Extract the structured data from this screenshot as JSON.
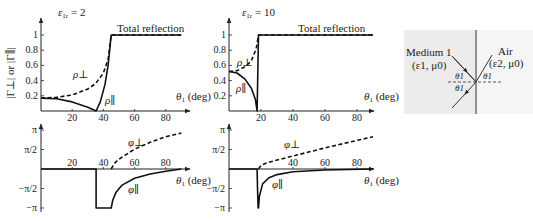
{
  "chart_data": [
    {
      "id": "mag_er2",
      "type": "line",
      "title": "ε1r = 2",
      "xlabel": "θ1 (deg)",
      "ylabel": "|Γ⊥| or |Γ∥|",
      "xlim": [
        0,
        90
      ],
      "ylim": [
        0,
        1
      ],
      "xticks": [
        20,
        40,
        60,
        80
      ],
      "yticks": [
        0.2,
        0.4,
        0.6,
        0.8,
        1
      ],
      "annotation": "Total reflection",
      "series": [
        {
          "name": "ρ⊥",
          "style": "dashed",
          "x": [
            0,
            10,
            20,
            30,
            35,
            40,
            43,
            45,
            90
          ],
          "y": [
            0.17,
            0.18,
            0.21,
            0.29,
            0.36,
            0.5,
            0.68,
            1,
            1
          ]
        },
        {
          "name": "ρ∥",
          "style": "solid",
          "x": [
            0,
            10,
            20,
            30,
            35.3,
            38,
            41,
            43,
            45,
            90
          ],
          "y": [
            0.17,
            0.16,
            0.12,
            0.05,
            0.0,
            0.12,
            0.35,
            0.6,
            1,
            1
          ]
        }
      ]
    },
    {
      "id": "mag_er10",
      "type": "line",
      "title": "ε1r = 10",
      "xlabel": "θ1 (deg)",
      "ylabel": "",
      "xlim": [
        0,
        90
      ],
      "ylim": [
        0,
        1
      ],
      "xticks": [
        20,
        40,
        60,
        80
      ],
      "yticks": [
        0.2,
        0.4,
        0.6,
        0.8,
        1
      ],
      "annotation": "Total reflection",
      "series": [
        {
          "name": "ρ⊥",
          "style": "dashed",
          "x": [
            0,
            5,
            10,
            14,
            17,
            18.43,
            90
          ],
          "y": [
            0.52,
            0.53,
            0.58,
            0.66,
            0.82,
            1,
            1
          ]
        },
        {
          "name": "ρ∥",
          "style": "solid",
          "x": [
            0,
            5,
            10,
            14,
            16.5,
            17.55,
            18.0,
            18.43,
            90
          ],
          "y": [
            0.52,
            0.5,
            0.42,
            0.3,
            0.15,
            0.0,
            0.5,
            1,
            1
          ]
        }
      ]
    },
    {
      "id": "phase_er2",
      "type": "line",
      "title": "",
      "xlabel": "θ1 (deg)",
      "ylabel": "",
      "xlim": [
        0,
        90
      ],
      "ylim": [
        -3.1416,
        3.1416
      ],
      "xticks": [
        20,
        40,
        60,
        80
      ],
      "yticks": [
        "π",
        "π/2",
        "−π/2",
        "−π"
      ],
      "series": [
        {
          "name": "φ⊥",
          "style": "dashed",
          "x": [
            45,
            47,
            50,
            60,
            70,
            80,
            90
          ],
          "y": [
            0,
            0.45,
            0.8,
            1.6,
            2.15,
            2.6,
            2.9
          ]
        },
        {
          "name": "φ∥",
          "style": "solid",
          "x": [
            0,
            35.3,
            35.3,
            45,
            46,
            48,
            52,
            60,
            70,
            80,
            90
          ],
          "y": [
            0,
            0,
            -3.1416,
            -3.1416,
            -2.5,
            -1.9,
            -1.3,
            -0.75,
            -0.4,
            -0.18,
            0
          ]
        }
      ]
    },
    {
      "id": "phase_er10",
      "type": "line",
      "title": "",
      "xlabel": "θ1 (deg)",
      "ylabel": "",
      "xlim": [
        0,
        90
      ],
      "ylim": [
        -3.1416,
        3.1416
      ],
      "xticks": [
        40,
        60,
        80
      ],
      "yticks": [
        "π",
        "π/2",
        "−π/2",
        "−π"
      ],
      "series": [
        {
          "name": "φ⊥",
          "style": "dashed",
          "x": [
            18.43,
            20,
            25,
            40,
            60,
            80,
            90
          ],
          "y": [
            0,
            0.3,
            0.55,
            1.05,
            1.7,
            2.3,
            2.6
          ]
        },
        {
          "name": "φ∥",
          "style": "solid",
          "x": [
            0,
            17.55,
            17.8,
            18.2,
            18.43,
            19,
            21,
            25,
            30,
            40,
            60,
            90
          ],
          "y": [
            0,
            0,
            -1.5,
            -3.1416,
            -3.1416,
            -2.2,
            -1.2,
            -0.7,
            -0.45,
            -0.22,
            -0.08,
            0
          ]
        }
      ]
    }
  ],
  "inset": {
    "medium_label": "Medium 1",
    "medium_params": "(ε1, μ0)",
    "air_label": "Air",
    "air_params": "(ε2, μ0)",
    "angle_incident": "θ1",
    "angle_reflected": "θ1",
    "angle_transmitted": "θ1"
  }
}
